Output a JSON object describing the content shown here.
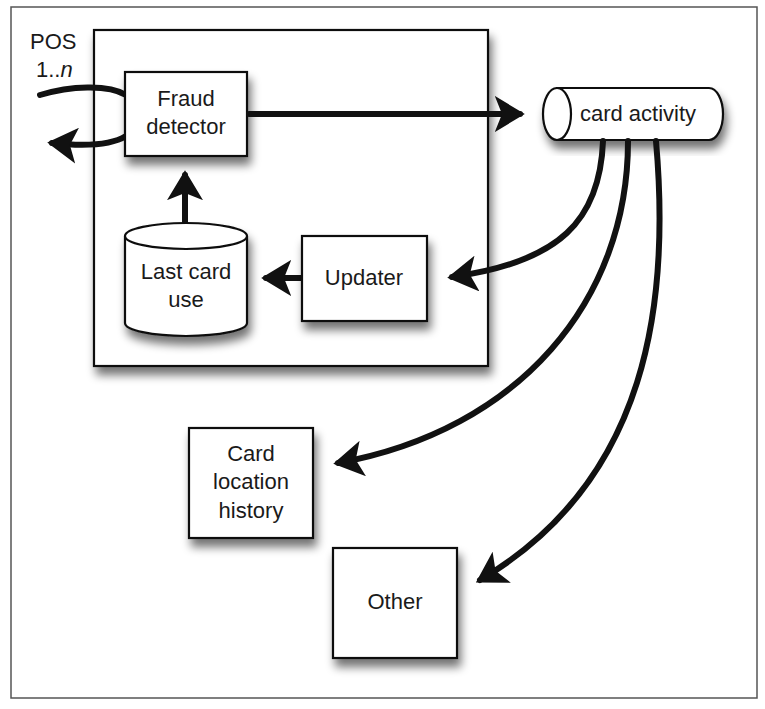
{
  "diagram": {
    "frame": {
      "stroke": "#555555"
    },
    "pos": {
      "line1": "POS",
      "line2_prefix": "1..",
      "line2_var": "n"
    },
    "container": {
      "name": "fraud-detection-system"
    },
    "nodes": {
      "fraud_detector": {
        "line1": "Fraud",
        "line2": "detector"
      },
      "last_card_use": {
        "line1": "Last card",
        "line2": "use"
      },
      "updater": {
        "label": "Updater"
      },
      "card_activity": {
        "label": "card activity"
      },
      "card_location_history": {
        "line1": "Card",
        "line2": "location",
        "line3": "history"
      },
      "other": {
        "label": "Other"
      }
    },
    "edges": [
      {
        "from": "POS",
        "to": "Fraud detector"
      },
      {
        "from": "Fraud detector",
        "to": "POS"
      },
      {
        "from": "Fraud detector",
        "to": "card activity"
      },
      {
        "from": "Last card use",
        "to": "Fraud detector"
      },
      {
        "from": "Updater",
        "to": "Last card use"
      },
      {
        "from": "card activity",
        "to": "Updater"
      },
      {
        "from": "card activity",
        "to": "Card location history"
      },
      {
        "from": "card activity",
        "to": "Other"
      }
    ]
  }
}
